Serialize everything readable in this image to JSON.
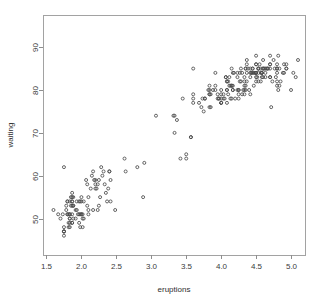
{
  "chart_data": {
    "type": "scatter",
    "title": "",
    "xlabel": "eruptions",
    "ylabel": "waiting",
    "xlim": [
      1.45,
      5.2
    ],
    "ylim": [
      41.5,
      97.5
    ],
    "xticks": [
      1.5,
      2.0,
      2.5,
      3.0,
      3.5,
      4.0,
      4.5,
      5.0
    ],
    "xtick_labels": [
      "1.5",
      "2.0",
      "2.5",
      "3.0",
      "3.5",
      "4.0",
      "4.5",
      "5.0"
    ],
    "yticks": [
      50,
      60,
      70,
      80,
      90
    ],
    "ytick_labels": [
      "50",
      "60",
      "70",
      "80",
      "90"
    ],
    "grid": false,
    "legend": false,
    "marker": "open-circle",
    "marker_size": 3,
    "marker_color": "#4a4a4a",
    "frame_color": "#a2a2a2",
    "background": "#ffffff",
    "n_points": 272,
    "series": [
      {
        "name": "faithful",
        "x": [
          3.6,
          1.8,
          3.333,
          2.283,
          4.533,
          2.883,
          4.7,
          3.6,
          1.95,
          4.35,
          1.833,
          3.917,
          4.2,
          1.75,
          4.7,
          2.167,
          1.75,
          4.8,
          1.6,
          4.25,
          1.8,
          1.75,
          3.45,
          3.067,
          4.533,
          3.6,
          1.967,
          4.083,
          3.85,
          4.433,
          4.3,
          4.467,
          3.367,
          4.033,
          3.833,
          2.017,
          1.867,
          4.833,
          1.833,
          4.783,
          4.35,
          1.883,
          4.567,
          1.75,
          4.533,
          3.317,
          3.833,
          2.1,
          4.633,
          2.0,
          4.8,
          4.716,
          1.833,
          4.833,
          1.733,
          4.883,
          3.717,
          1.667,
          4.567,
          4.317,
          2.233,
          4.5,
          1.75,
          4.8,
          1.817,
          4.4,
          4.167,
          4.7,
          2.067,
          4.7,
          4.033,
          1.967,
          4.5,
          4.0,
          1.983,
          5.067,
          2.017,
          4.567,
          3.883,
          3.6,
          4.133,
          4.333,
          4.1,
          2.633,
          4.067,
          4.933,
          3.95,
          4.517,
          2.167,
          4.0,
          2.2,
          4.333,
          1.867,
          4.817,
          1.833,
          4.3,
          4.667,
          3.75,
          1.867,
          4.9,
          2.483,
          4.367,
          2.1,
          4.5,
          4.05,
          1.867,
          4.7,
          1.783,
          4.85,
          3.683,
          4.733,
          2.3,
          4.9,
          4.417,
          1.7,
          4.633,
          2.317,
          4.6,
          1.817,
          4.417,
          2.617,
          4.067,
          4.25,
          1.967,
          4.6,
          3.767,
          1.917,
          4.5,
          2.267,
          4.65,
          1.867,
          4.167,
          2.8,
          4.333,
          1.833,
          4.383,
          1.883,
          4.933,
          2.033,
          3.733,
          4.233,
          2.233,
          4.533,
          4.817,
          4.333,
          1.983,
          4.633,
          2.017,
          5.1,
          1.8,
          5.033,
          4.0,
          2.4,
          4.6,
          3.567,
          4.0,
          4.5,
          4.083,
          1.8,
          3.967,
          2.2,
          4.15,
          2.0,
          3.833,
          3.5,
          4.583,
          2.367,
          5.0,
          1.933,
          4.617,
          1.917,
          2.083,
          4.583,
          3.333,
          4.167,
          4.333,
          4.5,
          2.417,
          4.0,
          4.167,
          1.883,
          4.583,
          4.25,
          3.767,
          2.033,
          4.433,
          4.083,
          1.833,
          4.417,
          2.183,
          4.8,
          1.833,
          4.8,
          4.1,
          3.966,
          4.233,
          3.5,
          4.366,
          2.25,
          4.667,
          2.1,
          4.35,
          4.133,
          1.867,
          4.6,
          1.783,
          4.367,
          3.85,
          1.933,
          4.5,
          2.383,
          4.7,
          1.867,
          3.833,
          3.417,
          4.233,
          2.4,
          4.8,
          2.0,
          4.15,
          1.867,
          4.267,
          1.75,
          4.483,
          4.0,
          4.117,
          4.083,
          4.267,
          3.917,
          4.55,
          4.083,
          2.417,
          4.183,
          2.217,
          4.45,
          1.883,
          1.85,
          4.283,
          3.95,
          2.333,
          4.15,
          2.35,
          4.933,
          2.9,
          4.583,
          3.833,
          2.083,
          4.367,
          2.133,
          4.35,
          2.2,
          4.45,
          3.567,
          4.5,
          4.15,
          3.817,
          3.917,
          4.45,
          2.0,
          4.283,
          4.767,
          4.533,
          1.85,
          4.25,
          1.983,
          2.25,
          4.75,
          4.117,
          2.15,
          4.417,
          1.817,
          4.467
        ],
        "y": [
          79,
          54,
          74,
          62,
          85,
          55,
          88,
          85,
          51,
          85,
          54,
          84,
          78,
          47,
          83,
          52,
          62,
          84,
          52,
          79,
          51,
          47,
          78,
          74,
          85,
          77,
          51,
          77,
          76,
          84,
          79,
          81,
          73,
          79,
          81,
          51,
          54,
          81,
          51,
          83,
          80,
          55,
          85,
          46,
          84,
          74,
          80,
          51,
          83,
          55,
          81,
          76,
          50,
          85,
          51,
          84,
          76,
          51,
          82,
          80,
          58,
          82,
          48,
          85,
          51,
          80,
          81,
          83,
          59,
          86,
          78,
          54,
          84,
          77,
          51,
          83,
          48,
          84,
          80,
          78,
          81,
          81,
          82,
          61,
          83,
          86,
          78,
          83,
          61,
          79,
          59,
          83,
          55,
          88,
          51,
          84,
          85,
          75,
          56,
          84,
          52,
          84,
          52,
          86,
          78,
          49,
          86,
          53,
          82,
          77,
          82,
          60,
          86,
          85,
          50,
          84,
          61,
          87,
          48,
          79,
          64,
          83,
          78,
          49,
          85,
          78,
          52,
          84,
          55,
          85,
          49,
          80,
          62,
          82,
          50,
          85,
          53,
          85,
          50,
          78,
          80,
          52,
          85,
          80,
          80,
          48,
          85,
          50,
          87,
          51,
          84,
          77,
          61,
          83,
          69,
          77,
          84,
          80,
          54,
          78,
          57,
          78,
          51,
          76,
          65,
          83,
          54,
          80,
          52,
          85,
          50,
          53,
          84,
          70,
          80,
          79,
          83,
          54,
          78,
          84,
          53,
          84,
          80,
          78,
          54,
          84,
          80,
          49,
          83,
          59,
          82,
          48,
          85,
          79,
          78,
          83,
          64,
          82,
          59,
          85,
          55,
          81,
          78,
          51,
          85,
          52,
          87,
          79,
          54,
          86,
          57,
          85,
          54,
          79,
          64,
          84,
          61,
          86,
          54,
          81,
          53,
          84,
          47,
          84,
          80,
          83,
          82,
          82,
          80,
          86,
          82,
          59,
          84,
          57,
          85,
          50,
          55,
          82,
          79,
          58,
          81,
          56,
          85,
          63,
          84,
          79,
          58,
          86,
          57,
          85,
          58,
          84,
          69,
          88,
          85,
          80,
          81,
          85,
          51,
          85,
          85,
          82,
          53,
          80,
          54,
          53,
          87,
          81,
          60,
          84,
          49,
          84
        ]
      }
    ]
  },
  "figure": {
    "plot_box": {
      "left": 43,
      "top": 15,
      "right": 305,
      "bottom": 255
    },
    "xlabel_text": "eruptions",
    "ylabel_text": "waiting"
  }
}
